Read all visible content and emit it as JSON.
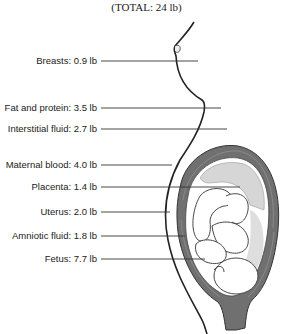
{
  "title": "(TOTAL: 24 lb)",
  "components": [
    {
      "label": "Breasts: 0.9 lb",
      "name": "Breasts",
      "weight_lb": 0.9,
      "y": 61,
      "line_end": 198
    },
    {
      "label": "Fat and protein: 3.5 lb",
      "name": "Fat and protein",
      "weight_lb": 3.5,
      "y": 108,
      "line_end": 221
    },
    {
      "label": "Interstitial fluid: 2.7 lb",
      "name": "Interstitial fluid",
      "weight_lb": 2.7,
      "y": 129,
      "line_end": 227
    },
    {
      "label": "Maternal blood: 4.0 lb",
      "name": "Maternal blood",
      "weight_lb": 4.0,
      "y": 165,
      "line_end": 172
    },
    {
      "label": "Placenta: 1.4 lb",
      "name": "Placenta",
      "weight_lb": 1.4,
      "y": 187,
      "line_end": 240
    },
    {
      "label": "Uterus: 2.0 lb",
      "name": "Uterus",
      "weight_lb": 2.0,
      "y": 212,
      "line_end": 170
    },
    {
      "label": "Amniotic fluid: 1.8 lb",
      "name": "Amniotic fluid",
      "weight_lb": 1.8,
      "y": 236,
      "line_end": 185
    },
    {
      "label": "Fetus: 7.7 lb",
      "name": "Fetus",
      "weight_lb": 7.7,
      "y": 259,
      "line_end": 205
    }
  ],
  "colors": {
    "line": "#333333",
    "uterus_wall": "#6a6a6a",
    "stipple": "#d8d8d8",
    "text": "#222222"
  }
}
